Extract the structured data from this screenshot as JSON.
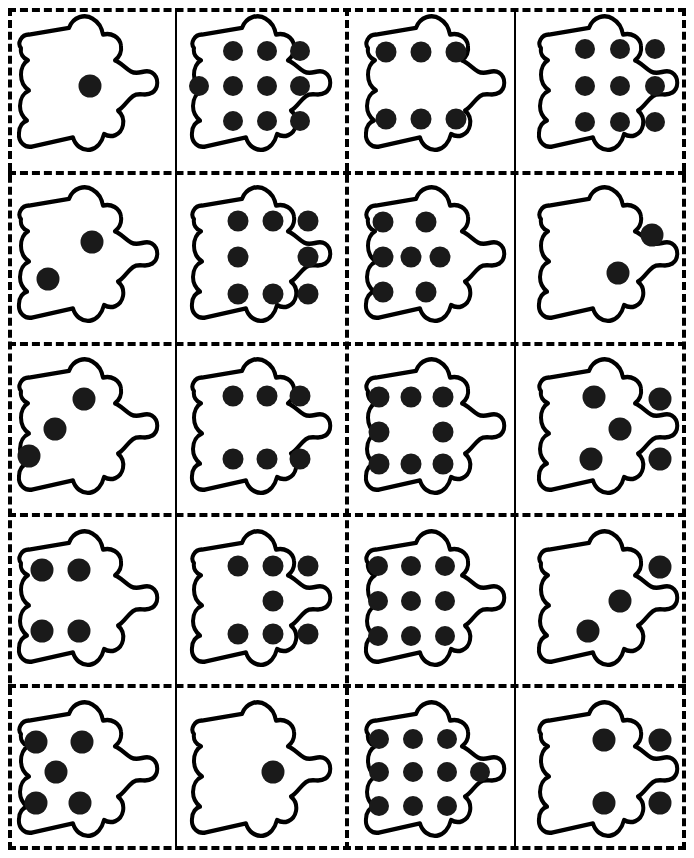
{
  "worksheet": {
    "title": "Dot Pattern Cut-Out Cards",
    "description": "Five rows by four columns of blob-shaped cards, each printed with a number of solid dots.",
    "columns": 4,
    "rows": 5,
    "page_width": 694,
    "page_height": 858,
    "colors": {
      "ink": "#000000",
      "dot": "#1a1a1a",
      "paper": "#ffffff"
    }
  },
  "cut_lines": {
    "outer_frame_style": "dashed",
    "vertical": [
      {
        "name": "cut-line-v1",
        "x": 175,
        "style": "solid"
      },
      {
        "name": "cut-line-v2",
        "x": 345,
        "style": "dashed"
      },
      {
        "name": "cut-line-v3",
        "x": 514,
        "style": "solid"
      }
    ],
    "horizontal": [
      {
        "name": "cut-line-h1",
        "y": 171,
        "style": "dashed"
      },
      {
        "name": "cut-line-h2",
        "y": 342,
        "style": "dashed"
      },
      {
        "name": "cut-line-h3",
        "y": 513,
        "style": "dashed"
      },
      {
        "name": "cut-line-h4",
        "y": 684,
        "style": "dashed"
      }
    ]
  },
  "cards": [
    {
      "id": "card-r1c1",
      "row": 1,
      "col": 1,
      "dot_count": 1,
      "arrangement": "single-center",
      "dots": [
        [
          52,
          50
        ]
      ]
    },
    {
      "id": "card-r1c2",
      "row": 1,
      "col": 2,
      "dot_count": 10,
      "arrangement": "3-4-3-grid",
      "dots": [
        [
          33,
          27
        ],
        [
          54,
          27
        ],
        [
          75,
          27
        ],
        [
          12,
          50
        ],
        [
          33,
          50
        ],
        [
          54,
          50
        ],
        [
          75,
          50
        ],
        [
          33,
          73
        ],
        [
          54,
          73
        ],
        [
          75,
          73
        ]
      ]
    },
    {
      "id": "card-r1c3",
      "row": 1,
      "col": 3,
      "dot_count": 6,
      "arrangement": "two-rows-of-three",
      "dots": [
        [
          20,
          28
        ],
        [
          42,
          28
        ],
        [
          64,
          28
        ],
        [
          20,
          72
        ],
        [
          42,
          72
        ],
        [
          64,
          72
        ]
      ]
    },
    {
      "id": "card-r1c4",
      "row": 1,
      "col": 4,
      "dot_count": 9,
      "arrangement": "3x3-grid",
      "dots": [
        [
          36,
          26
        ],
        [
          58,
          26
        ],
        [
          80,
          26
        ],
        [
          36,
          50
        ],
        [
          58,
          50
        ],
        [
          80,
          50
        ],
        [
          36,
          74
        ],
        [
          58,
          74
        ],
        [
          80,
          74
        ]
      ]
    },
    {
      "id": "card-r2c1",
      "row": 2,
      "col": 1,
      "dot_count": 2,
      "arrangement": "diagonal-pair",
      "dots": [
        [
          53,
          40
        ],
        [
          26,
          64
        ]
      ]
    },
    {
      "id": "card-r2c2",
      "row": 2,
      "col": 2,
      "dot_count": 8,
      "arrangement": "3-2-3-grid",
      "dots": [
        [
          36,
          26
        ],
        [
          58,
          26
        ],
        [
          80,
          26
        ],
        [
          36,
          50
        ],
        [
          80,
          50
        ],
        [
          36,
          74
        ],
        [
          58,
          74
        ],
        [
          80,
          74
        ]
      ]
    },
    {
      "id": "card-r2c3",
      "row": 2,
      "col": 3,
      "dot_count": 7,
      "arrangement": "2-3-2-grid",
      "dots": [
        [
          18,
          27
        ],
        [
          45,
          27
        ],
        [
          18,
          50
        ],
        [
          36,
          50
        ],
        [
          54,
          50
        ],
        [
          18,
          73
        ],
        [
          45,
          73
        ]
      ]
    },
    {
      "id": "card-r2c4",
      "row": 2,
      "col": 4,
      "dot_count": 2,
      "arrangement": "diagonal-pair-right",
      "dots": [
        [
          78,
          35
        ],
        [
          57,
          60
        ]
      ]
    },
    {
      "id": "card-r3c1",
      "row": 3,
      "col": 1,
      "dot_count": 3,
      "arrangement": "diagonal-three",
      "dots": [
        [
          48,
          30
        ],
        [
          30,
          50
        ],
        [
          14,
          68
        ]
      ]
    },
    {
      "id": "card-r3c2",
      "row": 3,
      "col": 2,
      "dot_count": 6,
      "arrangement": "two-rows-of-three",
      "dots": [
        [
          33,
          28
        ],
        [
          54,
          28
        ],
        [
          75,
          28
        ],
        [
          33,
          70
        ],
        [
          54,
          70
        ],
        [
          75,
          70
        ]
      ]
    },
    {
      "id": "card-r3c3",
      "row": 3,
      "col": 3,
      "dot_count": 8,
      "arrangement": "3-2-3-grid",
      "dots": [
        [
          16,
          29
        ],
        [
          36,
          29
        ],
        [
          56,
          29
        ],
        [
          16,
          52
        ],
        [
          56,
          52
        ],
        [
          16,
          73
        ],
        [
          36,
          73
        ],
        [
          56,
          73
        ]
      ]
    },
    {
      "id": "card-r3c4",
      "row": 3,
      "col": 4,
      "dot_count": 5,
      "arrangement": "five-quincunx",
      "dots": [
        [
          42,
          29
        ],
        [
          83,
          30
        ],
        [
          58,
          50
        ],
        [
          40,
          70
        ],
        [
          83,
          70
        ]
      ]
    },
    {
      "id": "card-r4c1",
      "row": 4,
      "col": 1,
      "dot_count": 4,
      "arrangement": "four-corners",
      "dots": [
        [
          22,
          30
        ],
        [
          45,
          30
        ],
        [
          22,
          70
        ],
        [
          45,
          70
        ]
      ]
    },
    {
      "id": "card-r4c2",
      "row": 4,
      "col": 2,
      "dot_count": 7,
      "arrangement": "3-1-3-grid",
      "dots": [
        [
          36,
          27
        ],
        [
          58,
          27
        ],
        [
          80,
          27
        ],
        [
          58,
          50
        ],
        [
          36,
          72
        ],
        [
          58,
          72
        ],
        [
          80,
          72
        ]
      ]
    },
    {
      "id": "card-r4c3",
      "row": 4,
      "col": 3,
      "dot_count": 9,
      "arrangement": "3x3-grid",
      "dots": [
        [
          15,
          27
        ],
        [
          36,
          27
        ],
        [
          57,
          27
        ],
        [
          15,
          50
        ],
        [
          36,
          50
        ],
        [
          57,
          50
        ],
        [
          15,
          73
        ],
        [
          36,
          73
        ],
        [
          57,
          73
        ]
      ]
    },
    {
      "id": "card-r4c4",
      "row": 4,
      "col": 4,
      "dot_count": 3,
      "arrangement": "diagonal-three-right",
      "dots": [
        [
          83,
          28
        ],
        [
          58,
          50
        ],
        [
          38,
          70
        ]
      ]
    },
    {
      "id": "card-r5c1",
      "row": 5,
      "col": 1,
      "dot_count": 5,
      "arrangement": "five-quincunx",
      "dots": [
        [
          18,
          30
        ],
        [
          47,
          30
        ],
        [
          31,
          50
        ],
        [
          18,
          70
        ],
        [
          46,
          70
        ]
      ]
    },
    {
      "id": "card-r5c2",
      "row": 5,
      "col": 2,
      "dot_count": 1,
      "arrangement": "single-center",
      "dots": [
        [
          58,
          50
        ]
      ]
    },
    {
      "id": "card-r5c3",
      "row": 5,
      "col": 3,
      "dot_count": 10,
      "arrangement": "3-4-3-grid",
      "dots": [
        [
          16,
          28
        ],
        [
          37,
          28
        ],
        [
          58,
          28
        ],
        [
          16,
          50
        ],
        [
          37,
          50
        ],
        [
          58,
          50
        ],
        [
          79,
          50
        ],
        [
          16,
          72
        ],
        [
          37,
          72
        ],
        [
          58,
          72
        ]
      ]
    },
    {
      "id": "card-r5c4",
      "row": 5,
      "col": 4,
      "dot_count": 4,
      "arrangement": "four-corners",
      "dots": [
        [
          48,
          29
        ],
        [
          83,
          29
        ],
        [
          48,
          70
        ],
        [
          83,
          70
        ]
      ]
    }
  ]
}
